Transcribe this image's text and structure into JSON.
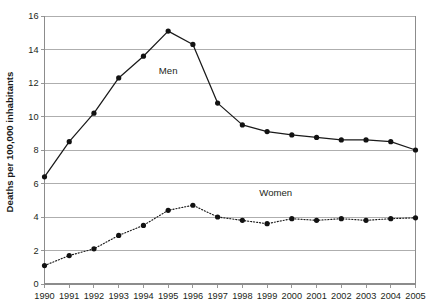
{
  "chart_data": {
    "type": "line",
    "title": "",
    "subtitle": "",
    "xlabel": "",
    "ylabel": "Deaths per 100,000 inhabitants",
    "x": [
      1990,
      1991,
      1992,
      1993,
      1994,
      1995,
      1996,
      1997,
      1998,
      1999,
      2000,
      2001,
      2002,
      2003,
      2004,
      2005
    ],
    "categories": [
      "1990",
      "1991",
      "1992",
      "1993",
      "1994",
      "1995",
      "1996",
      "1997",
      "1998",
      "1999",
      "2000",
      "2001",
      "2002",
      "2003",
      "2004",
      "2005"
    ],
    "series": [
      {
        "name": "Men",
        "style": "solid",
        "marker": "filled-circle",
        "color": "#1a1a1a",
        "values": [
          6.4,
          8.5,
          10.2,
          12.3,
          13.6,
          15.1,
          14.3,
          10.8,
          9.5,
          9.1,
          8.9,
          8.75,
          8.6,
          8.6,
          8.5,
          8.0
        ]
      },
      {
        "name": "Women",
        "style": "dotted",
        "marker": "filled-circle",
        "color": "#1a1a1a",
        "values": [
          1.1,
          1.7,
          2.1,
          2.9,
          3.5,
          4.4,
          4.7,
          4.0,
          3.8,
          3.6,
          3.9,
          3.8,
          3.9,
          3.8,
          3.9,
          3.95
        ]
      }
    ],
    "ylim": [
      0,
      16
    ],
    "ytick_step": 2,
    "yticks": [
      "0",
      "2",
      "4",
      "6",
      "8",
      "10",
      "12",
      "14",
      "16"
    ],
    "xlim": [
      1990,
      2005
    ],
    "grid": "horizontal",
    "legend": "inline-annotations",
    "annotations": [
      {
        "text": "Men",
        "x": 1995,
        "y": 12.55
      },
      {
        "text": "Women",
        "x": 1999.35,
        "y": 5.25
      }
    ]
  },
  "colors": {
    "background": "#ffffff",
    "ink": "#1a1a1a",
    "gridline": "#9a9a9a",
    "axis": "#8c8c8c"
  }
}
